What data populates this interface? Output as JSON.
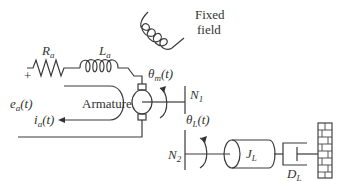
{
  "diagram": {
    "type": "dc-motor-gear-load-schematic",
    "labels": {
      "resistor": "R",
      "resistor_sub": "a",
      "inductor": "L",
      "inductor_sub": "a",
      "fixed_field_line1": "Fixed",
      "fixed_field_line2": "field",
      "plus": "+",
      "voltage": "e",
      "voltage_sub": "a",
      "voltage_arg": "(t)",
      "current": "i",
      "current_sub": "a",
      "current_arg": "(t)",
      "armature": "Armature",
      "theta_m": "θ",
      "theta_m_sub": "m",
      "theta_m_arg": "(t)",
      "gear1": "N",
      "gear1_sub": "1",
      "theta_l": "θ",
      "theta_l_sub": "L",
      "theta_l_arg": "(t)",
      "gear2": "N",
      "gear2_sub": "2",
      "inertia": "J",
      "inertia_sub": "L",
      "damper": "D",
      "damper_sub": "L"
    }
  }
}
